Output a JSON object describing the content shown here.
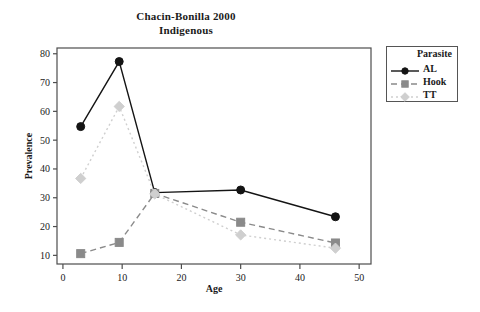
{
  "title": {
    "line1": "Chacin-Bonilla 2000",
    "line2": "Indigenous"
  },
  "legend": {
    "title": "Parasite",
    "items": [
      {
        "label": "AL",
        "color": "#141414",
        "dash": "none",
        "marker": "circle"
      },
      {
        "label": "Hook",
        "color": "#8a8a8a",
        "dash": "dash",
        "marker": "square"
      },
      {
        "label": "TT",
        "color": "#cfcfcf",
        "dash": "dot",
        "marker": "diamond"
      }
    ]
  },
  "chart_data": {
    "type": "line",
    "xlabel": "Age",
    "ylabel": "Prevalence",
    "xlim": [
      -1,
      52
    ],
    "ylim": [
      7,
      82
    ],
    "xticks": [
      0,
      10,
      20,
      30,
      40,
      50
    ],
    "yticks": [
      10,
      20,
      30,
      40,
      50,
      60,
      70,
      80
    ],
    "grid": false,
    "legend_position": "right-outside",
    "legend_title": "Parasite",
    "x": [
      3,
      9.5,
      15.5,
      30,
      46
    ],
    "series": [
      {
        "name": "AL",
        "color": "#141414",
        "dash": "none",
        "marker": "circle",
        "values": [
          54.7,
          77.3,
          31.8,
          32.7,
          23.4
        ]
      },
      {
        "name": "Hook",
        "color": "#8a8a8a",
        "dash": "dash",
        "marker": "square",
        "values": [
          10.6,
          14.5,
          31.5,
          21.5,
          14.3
        ]
      },
      {
        "name": "TT",
        "color": "#cfcfcf",
        "dash": "dot",
        "marker": "diamond",
        "values": [
          36.7,
          61.7,
          31.3,
          17.1,
          12.5
        ]
      }
    ]
  }
}
